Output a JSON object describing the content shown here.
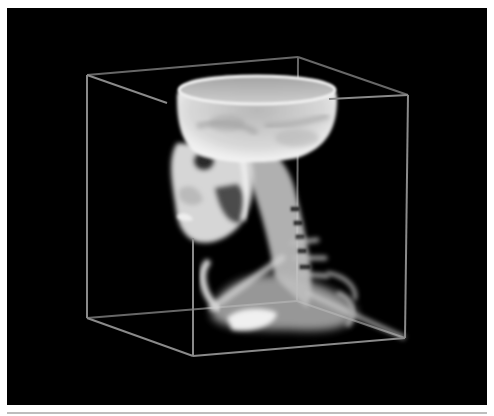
{
  "figure": {
    "title": "3D volume rendering of skull and cervical spine",
    "background": "#000000",
    "page_background": "#ffffff",
    "bounding_box": {
      "color": "#8a8a8a",
      "corners": {
        "top_left": [
          80,
          67
        ],
        "top_back": [
          291,
          49
        ],
        "top_right": [
          401,
          87
        ],
        "top_front": [
          186,
          100
        ],
        "bottom_left": [
          80,
          310
        ],
        "bottom_back": [
          290,
          293
        ],
        "bottom_right": [
          398,
          330
        ],
        "bottom_front": [
          186,
          348
        ]
      }
    },
    "subject": {
      "name": "skull-with-neck",
      "tone": "#e8e8e8"
    }
  },
  "divider": {
    "color": "#bdbdbd"
  }
}
